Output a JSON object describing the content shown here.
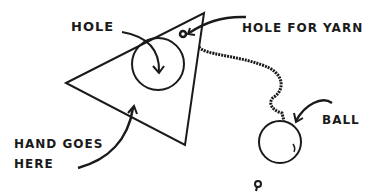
{
  "diagram": {
    "labels": {
      "hole": "HOLE",
      "hole_for_yarn": "HOLE FOR YARN",
      "hand_goes_here_line1": "HAND GOES",
      "hand_goes_here_line2": "HERE",
      "ball": "BALL"
    },
    "colors": {
      "ink": "#1a1a1a",
      "background": "#ffffff"
    },
    "shapes": {
      "triangle": [
        [
          66,
          83
        ],
        [
          204,
          13
        ],
        [
          185,
          145
        ]
      ],
      "hole_circle": {
        "cx": 158,
        "cy": 64,
        "r": 26
      },
      "ball_circle": {
        "cx": 280,
        "cy": 142,
        "r": 21
      }
    }
  }
}
